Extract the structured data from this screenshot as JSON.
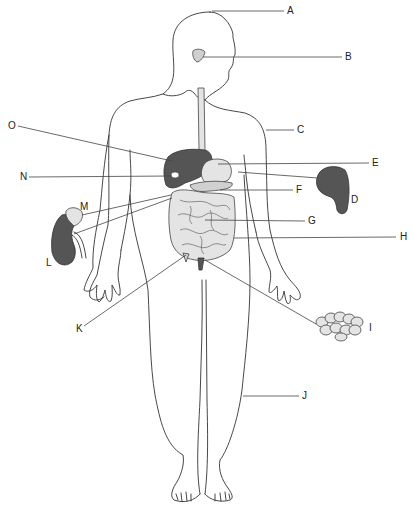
{
  "diagram": {
    "labels": [
      {
        "id": "A",
        "text": "A",
        "x": 287,
        "y": 8,
        "target": "top of head"
      },
      {
        "id": "B",
        "text": "B",
        "x": 345,
        "y": 53,
        "target": "pituitary/gland in head"
      },
      {
        "id": "C",
        "text": "C",
        "x": 297,
        "y": 126,
        "target": "body outline / skin"
      },
      {
        "id": "D",
        "text": "D",
        "x": 351,
        "y": 195,
        "target": "spleen"
      },
      {
        "id": "E",
        "text": "E",
        "x": 372,
        "y": 157,
        "target": "stomach"
      },
      {
        "id": "F",
        "text": "F",
        "x": 296,
        "y": 186,
        "target": "pancreas"
      },
      {
        "id": "G",
        "text": "G",
        "x": 308,
        "y": 217,
        "target": "small intestine"
      },
      {
        "id": "H",
        "text": "H",
        "x": 400,
        "y": 233,
        "target": "large intestine"
      },
      {
        "id": "I",
        "text": "I",
        "x": 368,
        "y": 324,
        "target": "fat cells"
      },
      {
        "id": "J",
        "text": "J",
        "x": 302,
        "y": 392,
        "target": "leg"
      },
      {
        "id": "K",
        "text": "K",
        "x": 76,
        "y": 324,
        "target": "appendix"
      },
      {
        "id": "L",
        "text": "L",
        "x": 46,
        "y": 258,
        "target": "kidney"
      },
      {
        "id": "M",
        "text": "M",
        "x": 80,
        "y": 203,
        "target": "adrenal gland"
      },
      {
        "id": "N",
        "text": "N",
        "x": 20,
        "y": 173,
        "target": "gallbladder"
      },
      {
        "id": "O",
        "text": "O",
        "x": 8,
        "y": 121,
        "target": "liver"
      }
    ]
  }
}
